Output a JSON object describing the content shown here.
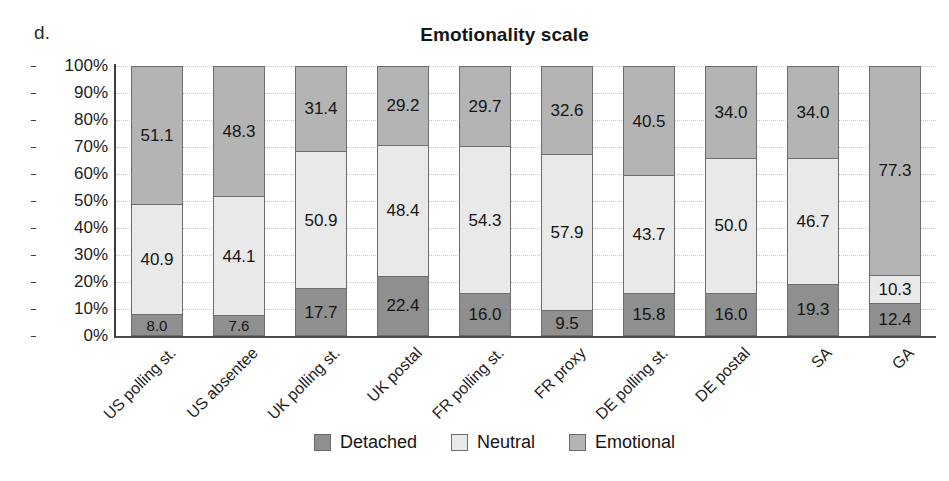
{
  "panel": {
    "label": "d."
  },
  "title": "Emotionality scale",
  "yaxis": {
    "ticks": [
      "100%",
      "90%",
      "80%",
      "70%",
      "60%",
      "50%",
      "40%",
      "30%",
      "20%",
      "10%",
      "0%"
    ]
  },
  "legend": {
    "items": [
      {
        "label": "Detached",
        "color": "#8f8f8f"
      },
      {
        "label": "Neutral",
        "color": "#e9e9e9"
      },
      {
        "label": "Emotional",
        "color": "#b4b4b4"
      }
    ]
  },
  "chart_data": {
    "type": "bar",
    "subtype": "stacked-percent",
    "title": "Emotionality scale",
    "xlabel": "",
    "ylabel": "",
    "ylim": [
      0,
      100
    ],
    "ytick_step": 10,
    "ytick_format": "percent",
    "grid": true,
    "legend_position": "bottom",
    "categories": [
      "US polling st.",
      "US absentee",
      "UK polling st.",
      "UK postal",
      "FR polling st.",
      "FR proxy",
      "DE polling st.",
      "DE postal",
      "SA",
      "GA"
    ],
    "series": [
      {
        "name": "Detached",
        "color": "#8f8f8f",
        "values": [
          8.0,
          7.6,
          17.7,
          22.4,
          16.0,
          9.5,
          15.8,
          16.0,
          19.3,
          12.4
        ],
        "labels": [
          "8.0",
          "7.6",
          "17.7",
          "22.4",
          "16.0",
          "9.5",
          "15.8",
          "16.0",
          "19.3",
          "12.4"
        ]
      },
      {
        "name": "Neutral",
        "color": "#e9e9e9",
        "values": [
          40.9,
          44.1,
          50.9,
          48.4,
          54.3,
          57.9,
          43.7,
          50.0,
          46.7,
          10.3
        ],
        "labels": [
          "40.9",
          "44.1",
          "50.9",
          "48.4",
          "54.3",
          "57.9",
          "43.7",
          "50.0",
          "46.7",
          "10.3"
        ]
      },
      {
        "name": "Emotional",
        "color": "#b4b4b4",
        "values": [
          51.1,
          48.3,
          31.4,
          29.2,
          29.7,
          32.6,
          40.5,
          34.0,
          34.0,
          77.3
        ],
        "labels": [
          "51.1",
          "48.3",
          "31.4",
          "29.2",
          "29.7",
          "32.6",
          "40.5",
          "34.0",
          "34.0",
          "77.3"
        ]
      }
    ]
  }
}
